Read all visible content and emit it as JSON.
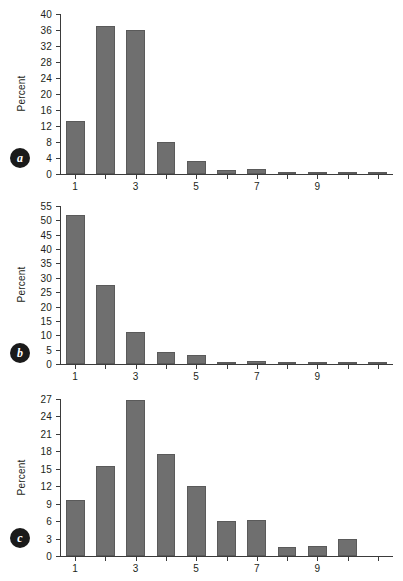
{
  "figure": {
    "background_color": "#ffffff",
    "bar_color": "#6f6f6f",
    "axis_color": "#3b3b3b",
    "text_color": "#231f20"
  },
  "chart_data": [
    {
      "type": "bar",
      "panel_label": "a",
      "title": "",
      "xlabel": "",
      "ylabel": "Percent",
      "categories": [
        "1",
        "2",
        "3",
        "4",
        "5",
        "6",
        "7",
        "8",
        "9",
        "10",
        "11"
      ],
      "x": [
        1,
        2,
        3,
        4,
        5,
        6,
        7,
        8,
        9,
        10,
        11
      ],
      "values": [
        13.3,
        37.0,
        36.0,
        7.9,
        3.2,
        1.1,
        1.2,
        0.3,
        0.3,
        0.3,
        0.3
      ],
      "ylim": [
        0,
        40
      ],
      "yticks": [
        0,
        4,
        8,
        12,
        16,
        20,
        24,
        28,
        32,
        36,
        40
      ],
      "ytick_labels": [
        "0",
        "4",
        "8",
        "12",
        "16",
        "20",
        "24",
        "28",
        "32",
        "36",
        "40"
      ],
      "xticks": [
        1,
        3,
        5,
        7,
        9
      ],
      "xtick_labels": [
        "1",
        "3",
        "5",
        "7",
        "9"
      ],
      "grid": false,
      "legend": false
    },
    {
      "type": "bar",
      "panel_label": "b",
      "title": "",
      "xlabel": "",
      "ylabel": "Percent",
      "categories": [
        "1",
        "2",
        "3",
        "4",
        "5",
        "6",
        "7",
        "8",
        "9",
        "10",
        "11"
      ],
      "x": [
        1,
        2,
        3,
        4,
        5,
        6,
        7,
        8,
        9,
        10,
        11
      ],
      "values": [
        51.8,
        27.6,
        11.1,
        4.3,
        3.1,
        0.8,
        0.9,
        0.4,
        0.3,
        0.3,
        0.3
      ],
      "ylim": [
        0,
        55
      ],
      "yticks": [
        0,
        5,
        10,
        15,
        20,
        25,
        30,
        35,
        40,
        45,
        50,
        55
      ],
      "ytick_labels": [
        "0",
        "5",
        "10",
        "15",
        "20",
        "25",
        "30",
        "35",
        "40",
        "45",
        "50",
        "55"
      ],
      "xticks": [
        1,
        3,
        5,
        7,
        9
      ],
      "xtick_labels": [
        "1",
        "3",
        "5",
        "7",
        "9"
      ],
      "grid": false,
      "legend": false
    },
    {
      "type": "bar",
      "panel_label": "c",
      "title": "",
      "xlabel": "",
      "ylabel": "Percent",
      "categories": [
        "1",
        "2",
        "3",
        "4",
        "5",
        "6",
        "7",
        "8",
        "9",
        "10",
        "11"
      ],
      "x": [
        1,
        2,
        3,
        4,
        5,
        6,
        7,
        8,
        9,
        10,
        11
      ],
      "values": [
        9.6,
        15.5,
        26.8,
        17.5,
        12.1,
        6.0,
        6.2,
        1.5,
        1.7,
        2.9,
        0.0
      ],
      "ylim": [
        0,
        27
      ],
      "yticks": [
        0,
        3,
        6,
        9,
        12,
        15,
        18,
        21,
        24,
        27
      ],
      "ytick_labels": [
        "0",
        "3",
        "6",
        "9",
        "12",
        "15",
        "18",
        "21",
        "24",
        "27"
      ],
      "xticks": [
        1,
        3,
        5,
        7,
        9
      ],
      "xtick_labels": [
        "1",
        "3",
        "5",
        "7",
        "9"
      ],
      "grid": false,
      "legend": false
    }
  ],
  "panels": [
    {
      "badge": "a",
      "ylabel": "Percent"
    },
    {
      "badge": "b",
      "ylabel": "Percent"
    },
    {
      "badge": "c",
      "ylabel": "Percent"
    }
  ]
}
